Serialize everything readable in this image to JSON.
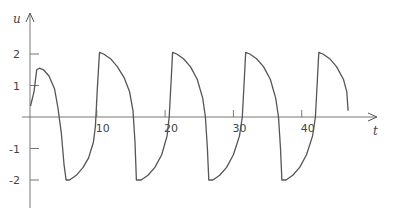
{
  "chart_data": {
    "type": "line",
    "title": "",
    "xlabel": "t",
    "ylabel": "u",
    "xlim": [
      0,
      51
    ],
    "ylim": [
      -2.8,
      2.4
    ],
    "grid": false,
    "legend": null,
    "x_ticks": [
      10,
      20,
      30,
      40
    ],
    "x_tick_labels": [
      "10",
      "20",
      "30",
      "40"
    ],
    "y_ticks": [
      2,
      1,
      -1,
      -2
    ],
    "y_tick_labels": [
      "2",
      "1",
      "-1",
      "-2"
    ],
    "series": [
      {
        "name": "u(t)",
        "color": "#555555",
        "points": [
          [
            0.3,
            0.35
          ],
          [
            0.8,
            0.8
          ],
          [
            1.2,
            1.5
          ],
          [
            1.6,
            1.55
          ],
          [
            2.2,
            1.5
          ],
          [
            3.0,
            1.3
          ],
          [
            3.8,
            0.9
          ],
          [
            4.3,
            0.3
          ],
          [
            4.8,
            -0.5
          ],
          [
            5.2,
            -1.5
          ],
          [
            5.5,
            -2.0
          ],
          [
            6.0,
            -2.0
          ],
          [
            7.0,
            -1.85
          ],
          [
            8.0,
            -1.6
          ],
          [
            8.8,
            -1.3
          ],
          [
            9.5,
            -0.8
          ],
          [
            9.8,
            -0.3
          ],
          [
            10.1,
            1.0
          ],
          [
            10.4,
            2.05
          ],
          [
            11.0,
            2.0
          ],
          [
            12.0,
            1.85
          ],
          [
            13.0,
            1.6
          ],
          [
            14.0,
            1.25
          ],
          [
            14.8,
            0.8
          ],
          [
            15.3,
            0.2
          ],
          [
            15.6,
            -0.8
          ],
          [
            15.8,
            -2.0
          ],
          [
            16.5,
            -2.0
          ],
          [
            17.5,
            -1.85
          ],
          [
            18.5,
            -1.6
          ],
          [
            19.5,
            -1.2
          ],
          [
            20.3,
            -0.6
          ],
          [
            20.6,
            0.0
          ],
          [
            20.9,
            1.2
          ],
          [
            21.1,
            2.05
          ],
          [
            21.7,
            2.0
          ],
          [
            22.7,
            1.85
          ],
          [
            23.7,
            1.6
          ],
          [
            24.7,
            1.2
          ],
          [
            25.5,
            0.6
          ],
          [
            25.9,
            0.0
          ],
          [
            26.2,
            -1.0
          ],
          [
            26.4,
            -2.0
          ],
          [
            27.0,
            -2.0
          ],
          [
            28.0,
            -1.85
          ],
          [
            29.0,
            -1.6
          ],
          [
            30.0,
            -1.2
          ],
          [
            30.9,
            -0.6
          ],
          [
            31.3,
            0.0
          ],
          [
            31.6,
            1.2
          ],
          [
            31.8,
            2.05
          ],
          [
            32.4,
            2.0
          ],
          [
            33.4,
            1.85
          ],
          [
            34.4,
            1.6
          ],
          [
            35.4,
            1.2
          ],
          [
            36.2,
            0.6
          ],
          [
            36.6,
            0.0
          ],
          [
            36.9,
            -1.0
          ],
          [
            37.1,
            -2.0
          ],
          [
            37.7,
            -2.0
          ],
          [
            38.7,
            -1.85
          ],
          [
            39.7,
            -1.6
          ],
          [
            40.7,
            -1.2
          ],
          [
            41.6,
            -0.6
          ],
          [
            42.0,
            0.0
          ],
          [
            42.3,
            1.2
          ],
          [
            42.5,
            2.05
          ],
          [
            43.1,
            2.0
          ],
          [
            44.1,
            1.85
          ],
          [
            45.1,
            1.6
          ],
          [
            46.1,
            1.2
          ],
          [
            46.6,
            0.8
          ],
          [
            46.8,
            0.2
          ]
        ]
      }
    ]
  },
  "axes": {
    "x_label": "t",
    "y_label": "u"
  }
}
